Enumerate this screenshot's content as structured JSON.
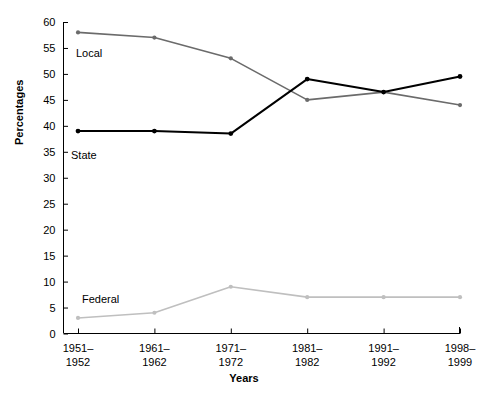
{
  "chart_data": {
    "type": "line",
    "title": "",
    "xlabel": "Years",
    "ylabel": "Percentages",
    "grid": false,
    "legend_position": "inline-series-labels",
    "categories": [
      "1951–\n1952",
      "1961–\n1962",
      "1971–\n1972",
      "1981–\n1982",
      "1991–\n1992",
      "1998–\n1999"
    ],
    "x_tick_lines": [
      {
        "top": "1951–",
        "bottom": "1952"
      },
      {
        "top": "1961–",
        "bottom": "1962"
      },
      {
        "top": "1971–",
        "bottom": "1972"
      },
      {
        "top": "1981–",
        "bottom": "1982"
      },
      {
        "top": "1991–",
        "bottom": "1992"
      },
      {
        "top": "1998–",
        "bottom": "1999"
      }
    ],
    "ylim": [
      0,
      60
    ],
    "yticks": [
      0,
      5,
      10,
      15,
      20,
      25,
      30,
      35,
      40,
      45,
      50,
      55,
      60
    ],
    "ytick_labels": [
      "0",
      "5",
      "10",
      "15",
      "20",
      "25",
      "30",
      "35",
      "40",
      "45",
      "50",
      "55",
      "60"
    ],
    "series": [
      {
        "name": "Local",
        "label": "Local",
        "color": "#6b6b6b",
        "values": [
          58,
          57,
          53,
          45,
          46.5,
          44
        ]
      },
      {
        "name": "State",
        "label": "State",
        "color": "#000000",
        "values": [
          39,
          39,
          38.5,
          49,
          46.5,
          49.5
        ]
      },
      {
        "name": "Federal",
        "label": "Federal",
        "color": "#bfbfbf",
        "values": [
          3,
          4,
          9,
          7,
          7,
          7
        ]
      }
    ],
    "series_label_positions": [
      {
        "name": "Local",
        "left": 76,
        "top": 48
      },
      {
        "name": "State",
        "left": 71,
        "top": 150
      },
      {
        "name": "Federal",
        "left": 82,
        "top": 294
      }
    ]
  }
}
